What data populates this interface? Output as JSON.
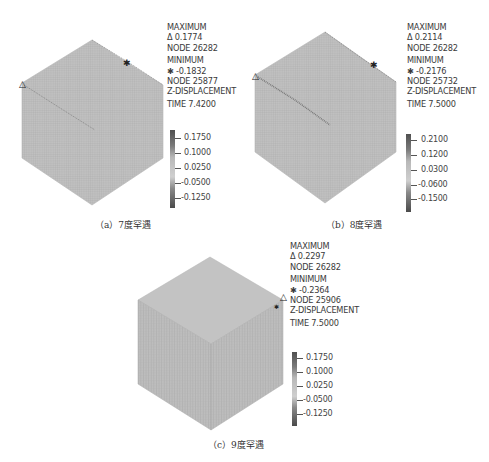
{
  "figure": {
    "panels": [
      {
        "id": "a",
        "caption": "（a）7度罕遇",
        "info": {
          "max_label": "MAXIMUM",
          "max_value": "Δ 0.1774",
          "max_node": "NODE 26282",
          "min_label": "MINIMUM",
          "min_value": "✱ -0.1832",
          "min_node": "NODE 25877",
          "quantity": "Z-DISPLACEMENT",
          "time": "TIME 7.4200"
        },
        "legend": [
          "0.1750",
          "0.1000",
          "0.0250",
          "-0.0500",
          "-0.1250"
        ]
      },
      {
        "id": "b",
        "caption": "（b）8度罕遇",
        "info": {
          "max_label": "MAXIMUM",
          "max_value": "Δ 0.2114",
          "max_node": "NODE 26282",
          "min_label": "MINIMUM",
          "min_value": "✱ -0.2176",
          "min_node": "NODE 25732",
          "quantity": "Z-DISPLACEMENT",
          "time": "TIME 7.5000"
        },
        "legend": [
          "0.2100",
          "0.1200",
          "0.0300",
          "-0.0600",
          "-0.1500"
        ]
      },
      {
        "id": "c",
        "caption": "（c）9度罕遇",
        "info": {
          "max_label": "MAXIMUM",
          "max_value": "Δ 0.2297",
          "max_node": "NODE 26282",
          "min_label": "MINIMUM",
          "min_value": "✱ -0.2364",
          "min_node": "NODE 25906",
          "quantity": "Z-DISPLACEMENT",
          "time": "TIME 7.5000"
        },
        "legend": [
          "0.1750",
          "0.1000",
          "0.0250",
          "-0.0500",
          "-0.1250"
        ]
      }
    ],
    "icons": {
      "max_marker": "triangle-icon",
      "min_marker": "asterisk-icon"
    },
    "colors": {
      "mesh_fill": "#bdbdbd",
      "mesh_line": "#a4a4a4",
      "bar_dark": "#555555",
      "bar_light": "#c8c8c8"
    }
  }
}
